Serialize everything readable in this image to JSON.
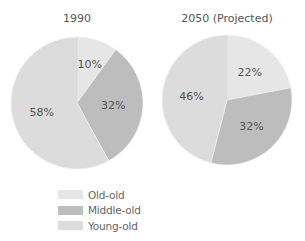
{
  "chart_data": [
    {
      "type": "pie",
      "title": "1990",
      "categories": [
        "Old-old",
        "Middle-old",
        "Young-old"
      ],
      "values": [
        10,
        32,
        58
      ],
      "labels": [
        "10%",
        "32%",
        "58%"
      ],
      "colors": [
        "#e6e6e6",
        "#bdbdbd",
        "#dcdcdc"
      ]
    },
    {
      "type": "pie",
      "title": "2050 (Projected)",
      "categories": [
        "Old-old",
        "Middle-old",
        "Young-old"
      ],
      "values": [
        22,
        32,
        46
      ],
      "labels": [
        "22%",
        "32%",
        "46%"
      ],
      "colors": [
        "#e6e6e6",
        "#bdbdbd",
        "#dcdcdc"
      ]
    }
  ],
  "legend": {
    "placement": "bottom-left",
    "items": [
      {
        "label": "Old-old",
        "color": "#e6e6e6"
      },
      {
        "label": "Middle-old",
        "color": "#bdbdbd"
      },
      {
        "label": "Young-old",
        "color": "#dcdcdc"
      }
    ]
  }
}
